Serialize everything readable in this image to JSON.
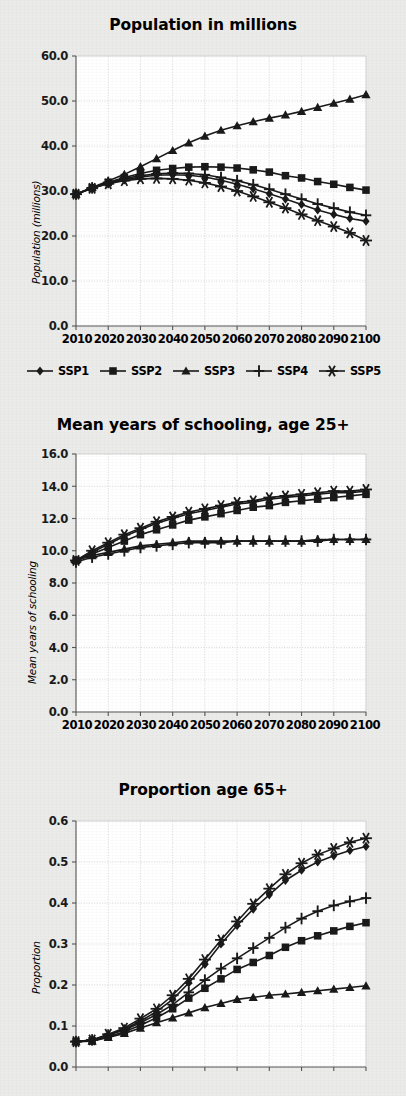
{
  "page": {
    "background_color": "#ebebea",
    "ink_color": "#1a1a1a",
    "plot_background": "#ffffff",
    "gridline_color": "#d0d0d0"
  },
  "legend": {
    "entries": [
      {
        "label": "SSP1",
        "marker": "diamond"
      },
      {
        "label": "SSP2",
        "marker": "square"
      },
      {
        "label": "SSP3",
        "marker": "triangle"
      },
      {
        "label": "SSP4",
        "marker": "plus"
      },
      {
        "label": "SSP5",
        "marker": "asterisk"
      }
    ]
  },
  "chart_data": [
    {
      "id": "population",
      "type": "line",
      "title": "Population in millions",
      "xlabel": "",
      "ylabel": "Population (millions)",
      "x": [
        2010,
        2015,
        2020,
        2025,
        2030,
        2035,
        2040,
        2045,
        2050,
        2055,
        2060,
        2065,
        2070,
        2075,
        2080,
        2085,
        2090,
        2095,
        2100
      ],
      "xticks": [
        "2010",
        "2020",
        "2030",
        "2040",
        "2050",
        "2060",
        "2070",
        "2080",
        "2090",
        "2100"
      ],
      "yticks": [
        "0.0",
        "10.0",
        "20.0",
        "30.0",
        "40.0",
        "50.0",
        "60.0"
      ],
      "ylim": [
        0,
        60
      ],
      "xlim": [
        2010,
        2100
      ],
      "grid": true,
      "legend_position": "bottom",
      "series": [
        {
          "name": "SSP1",
          "marker": "diamond",
          "values": [
            29.3,
            30.6,
            31.7,
            32.5,
            33.1,
            33.5,
            33.6,
            33.5,
            33.1,
            32.4,
            31.5,
            30.5,
            29.4,
            28.2,
            27.0,
            25.8,
            24.8,
            23.9,
            23.3
          ]
        },
        {
          "name": "SSP2",
          "marker": "square",
          "values": [
            29.3,
            30.7,
            31.9,
            33.0,
            33.9,
            34.6,
            35.0,
            35.3,
            35.4,
            35.3,
            35.1,
            34.7,
            34.2,
            33.4,
            32.9,
            32.1,
            31.5,
            30.8,
            30.2
          ]
        },
        {
          "name": "SSP3",
          "marker": "triangle",
          "values": [
            29.3,
            30.8,
            32.2,
            33.7,
            35.4,
            37.2,
            39.0,
            40.7,
            42.2,
            43.5,
            44.5,
            45.4,
            46.2,
            46.9,
            47.7,
            48.6,
            49.5,
            50.4,
            51.4
          ]
        },
        {
          "name": "SSP4",
          "marker": "plus",
          "values": [
            29.3,
            30.7,
            31.9,
            32.8,
            33.4,
            33.8,
            34.0,
            33.9,
            33.6,
            33.0,
            32.3,
            31.4,
            30.4,
            29.3,
            28.2,
            27.1,
            26.2,
            25.3,
            24.6
          ]
        },
        {
          "name": "SSP5",
          "marker": "asterisk",
          "values": [
            29.3,
            30.6,
            31.6,
            32.3,
            32.7,
            32.8,
            32.7,
            32.4,
            31.8,
            31.0,
            30.0,
            28.8,
            27.5,
            26.2,
            24.8,
            23.4,
            22.1,
            20.7,
            19.0
          ]
        }
      ]
    },
    {
      "id": "schooling",
      "type": "line",
      "title": "Mean years of schooling, age 25+",
      "xlabel": "",
      "ylabel": "Mean years of schooling",
      "x": [
        2010,
        2015,
        2020,
        2025,
        2030,
        2035,
        2040,
        2045,
        2050,
        2055,
        2060,
        2065,
        2070,
        2075,
        2080,
        2085,
        2090,
        2095,
        2100
      ],
      "xticks": [
        "2010",
        "2020",
        "2030",
        "2040",
        "2050",
        "2060",
        "2070",
        "2080",
        "2090",
        "2100"
      ],
      "yticks": [
        "0.0",
        "2.0",
        "4.0",
        "6.0",
        "8.0",
        "10.0",
        "12.0",
        "14.0",
        "16.0"
      ],
      "ylim": [
        0,
        16
      ],
      "xlim": [
        2010,
        2100
      ],
      "grid": true,
      "legend_position": "none",
      "series": [
        {
          "name": "SSP1",
          "marker": "diamond",
          "values": [
            9.4,
            9.9,
            10.4,
            10.9,
            11.3,
            11.7,
            12.0,
            12.3,
            12.5,
            12.7,
            12.9,
            13.0,
            13.2,
            13.3,
            13.4,
            13.5,
            13.6,
            13.6,
            13.7
          ]
        },
        {
          "name": "SSP2",
          "marker": "square",
          "values": [
            9.4,
            9.8,
            10.2,
            10.6,
            11.0,
            11.3,
            11.6,
            11.9,
            12.1,
            12.3,
            12.5,
            12.7,
            12.8,
            13.0,
            13.1,
            13.2,
            13.3,
            13.4,
            13.5
          ]
        },
        {
          "name": "SSP3",
          "marker": "triangle",
          "values": [
            9.4,
            9.7,
            9.9,
            10.1,
            10.3,
            10.4,
            10.5,
            10.6,
            10.6,
            10.6,
            10.6,
            10.6,
            10.6,
            10.6,
            10.6,
            10.7,
            10.7,
            10.7,
            10.7
          ]
        },
        {
          "name": "SSP4",
          "marker": "plus",
          "values": [
            9.3,
            9.6,
            9.8,
            10.0,
            10.2,
            10.3,
            10.4,
            10.5,
            10.5,
            10.5,
            10.6,
            10.6,
            10.6,
            10.6,
            10.6,
            10.6,
            10.7,
            10.7,
            10.7
          ]
        },
        {
          "name": "SSP5",
          "marker": "asterisk",
          "values": [
            9.4,
            10.0,
            10.5,
            11.0,
            11.4,
            11.8,
            12.1,
            12.4,
            12.6,
            12.8,
            13.0,
            13.1,
            13.3,
            13.4,
            13.5,
            13.6,
            13.7,
            13.7,
            13.8
          ]
        }
      ]
    },
    {
      "id": "proportion65",
      "type": "line",
      "title": "Proportion age 65+",
      "xlabel": "",
      "ylabel": "Proportion",
      "x": [
        2010,
        2015,
        2020,
        2025,
        2030,
        2035,
        2040,
        2045,
        2050,
        2055,
        2060,
        2065,
        2070,
        2075,
        2080,
        2085,
        2090,
        2095,
        2100
      ],
      "xticks": [
        "2010",
        "2020",
        "2030",
        "2040",
        "2050",
        "2060",
        "2070",
        "2080",
        "2090",
        "2100"
      ],
      "yticks": [
        "0.0",
        "0.1",
        "0.2",
        "0.3",
        "0.4",
        "0.5",
        "0.6"
      ],
      "ylim": [
        0,
        0.6
      ],
      "xlim": [
        2010,
        2100
      ],
      "grid": true,
      "legend_position": "none",
      "series": [
        {
          "name": "SSP1",
          "marker": "diamond",
          "values": [
            0.062,
            0.065,
            0.078,
            0.092,
            0.112,
            0.135,
            0.165,
            0.205,
            0.25,
            0.3,
            0.345,
            0.385,
            0.42,
            0.455,
            0.48,
            0.5,
            0.515,
            0.528,
            0.538
          ]
        },
        {
          "name": "SSP2",
          "marker": "square",
          "values": [
            0.062,
            0.064,
            0.074,
            0.086,
            0.102,
            0.12,
            0.142,
            0.168,
            0.192,
            0.215,
            0.238,
            0.255,
            0.272,
            0.292,
            0.308,
            0.32,
            0.332,
            0.343,
            0.352
          ]
        },
        {
          "name": "SSP3",
          "marker": "triangle",
          "values": [
            0.062,
            0.063,
            0.072,
            0.082,
            0.095,
            0.108,
            0.12,
            0.132,
            0.145,
            0.155,
            0.165,
            0.17,
            0.175,
            0.178,
            0.182,
            0.186,
            0.19,
            0.194,
            0.198
          ]
        },
        {
          "name": "SSP4",
          "marker": "plus",
          "values": [
            0.062,
            0.066,
            0.078,
            0.09,
            0.108,
            0.128,
            0.152,
            0.182,
            0.212,
            0.24,
            0.265,
            0.29,
            0.315,
            0.34,
            0.362,
            0.38,
            0.394,
            0.404,
            0.412
          ]
        },
        {
          "name": "SSP5",
          "marker": "asterisk",
          "values": [
            0.062,
            0.066,
            0.08,
            0.095,
            0.118,
            0.142,
            0.175,
            0.215,
            0.262,
            0.31,
            0.355,
            0.398,
            0.435,
            0.47,
            0.497,
            0.518,
            0.533,
            0.548,
            0.558
          ]
        }
      ]
    }
  ]
}
